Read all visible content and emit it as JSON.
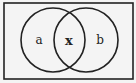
{
  "diagram": {
    "type": "venn",
    "universe": {
      "x": 4,
      "y": 3,
      "width": 129,
      "height": 76,
      "stroke": "#222222",
      "fill": "#f4f4f4"
    },
    "sets": [
      {
        "name": "left-set",
        "cx": 53,
        "cy": 40,
        "r": 32
      },
      {
        "name": "right-set",
        "cx": 86,
        "cy": 40,
        "r": 32
      }
    ],
    "regions": [
      {
        "name": "left-only",
        "label": "a",
        "x": 39,
        "y": 44
      },
      {
        "name": "intersection",
        "label": "x",
        "x": 69,
        "y": 45
      },
      {
        "name": "right-only",
        "label": "b",
        "x": 100,
        "y": 44
      }
    ],
    "colors": {
      "stroke": "#222222",
      "background": "#f4f4f4"
    }
  }
}
